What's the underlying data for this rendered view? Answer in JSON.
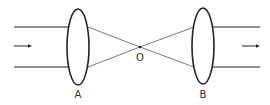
{
  "diagram": {
    "lens_a": {
      "label": "A"
    },
    "lens_b": {
      "label": "B"
    },
    "focal_point": {
      "label": "O"
    },
    "colors": {
      "stroke": "#222222",
      "ray": "#555555",
      "text": "#333333"
    }
  }
}
